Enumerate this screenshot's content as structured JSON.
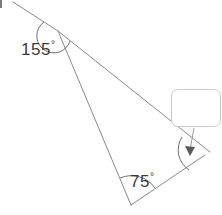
{
  "diagram": {
    "type": "geometry-angle-diagram",
    "stroke_color": "#8a8a8a",
    "label_color": "#3a3a3a",
    "box_border_color": "#c9c9c9",
    "angles": [
      {
        "id": "exterior-angle",
        "value": "155",
        "degree_symbol": "°",
        "label": "155°",
        "vertex": "apex",
        "vertex_x": 58,
        "vertex_y": 31
      },
      {
        "id": "bottom-angle",
        "value": "75",
        "degree_symbol": "°",
        "label": "75°",
        "vertex": "bottom",
        "vertex_x": 131,
        "vertex_y": 205
      },
      {
        "id": "unknown-angle",
        "value": "",
        "degree_symbol": "",
        "label": "",
        "vertex": "right",
        "vertex_x": 205,
        "vertex_y": 155
      }
    ],
    "answer_box": {
      "value": "",
      "placeholder": ""
    },
    "vertices": {
      "apex": {
        "x": 58,
        "y": 31
      },
      "bottom": {
        "x": 131,
        "y": 205
      },
      "right": {
        "x": 205,
        "y": 155
      },
      "ray_end_top_left": {
        "x": 13,
        "y": 2
      }
    }
  }
}
